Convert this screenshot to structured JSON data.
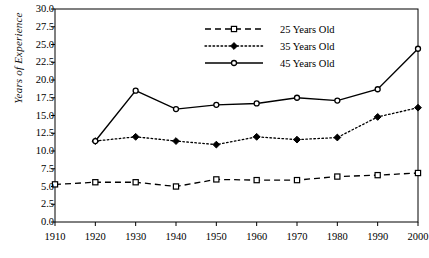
{
  "chart_data": {
    "type": "line",
    "title": "",
    "subtitle": "",
    "xlabel": "",
    "ylabel": "Years of Experience",
    "x": [
      1910,
      1920,
      1930,
      1940,
      1950,
      1960,
      1970,
      1980,
      1990,
      2000
    ],
    "xtick_labels": [
      "1910",
      "1920",
      "1930",
      "1940",
      "1950",
      "1960",
      "1970",
      "1980",
      "1990",
      "2000"
    ],
    "xlim": [
      1910,
      2000
    ],
    "ylim": [
      0.0,
      30.0
    ],
    "ytick_labels": [
      "0.0",
      "2.5",
      "5.0",
      "7.5",
      "10.0",
      "12.5",
      "15.0",
      "17.5",
      "20.0",
      "22.5",
      "25.0",
      "27.5",
      "30.0"
    ],
    "ytick_values": [
      0.0,
      2.5,
      5.0,
      7.5,
      10.0,
      12.5,
      15.0,
      17.5,
      20.0,
      22.5,
      25.0,
      27.5,
      30.0
    ],
    "grid": false,
    "legend_position": "top-center-right",
    "series": [
      {
        "name": "25 Years Old",
        "marker": "open-square",
        "linestyle": "dashed",
        "color": "#000000",
        "x": [
          1910,
          1920,
          1930,
          1940,
          1950,
          1960,
          1970,
          1980,
          1990,
          2000
        ],
        "values": [
          5.3,
          5.6,
          5.6,
          5.0,
          6.0,
          5.9,
          5.9,
          6.4,
          6.6,
          6.9
        ]
      },
      {
        "name": "35 Years Old",
        "marker": "filled-diamond",
        "linestyle": "dotted",
        "color": "#000000",
        "x": [
          1920,
          1930,
          1940,
          1950,
          1960,
          1970,
          1980,
          1990,
          2000
        ],
        "values": [
          11.4,
          12.0,
          11.4,
          10.9,
          12.0,
          11.6,
          11.9,
          14.8,
          16.1
        ]
      },
      {
        "name": "45 Years Old",
        "marker": "open-circle",
        "linestyle": "solid",
        "color": "#000000",
        "x": [
          1920,
          1930,
          1940,
          1950,
          1960,
          1970,
          1980,
          1990,
          2000
        ],
        "values": [
          11.4,
          18.5,
          15.9,
          16.5,
          16.7,
          17.5,
          17.1,
          18.7,
          24.4
        ]
      }
    ]
  },
  "legend": {
    "entries": [
      {
        "label": "25 Years Old"
      },
      {
        "label": "35 Years Old"
      },
      {
        "label": "45 Years Old"
      }
    ]
  }
}
